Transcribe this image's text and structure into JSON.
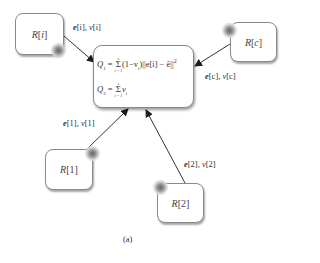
{
  "diagram": {
    "type": "network-diagram",
    "caption": "(a)",
    "center_node": {
      "q1_lhs": "Q",
      "q1_lhs_sub": "1",
      "q1_sum_upper": "c",
      "q1_sum_lower": "i = 1",
      "q1_rhs": "(1−v",
      "q1_rhs_sub": "i",
      "q1_rhs2": ")||e[i] − ē||",
      "q1_rhs_sup": "2",
      "q2_lhs": "Q",
      "q2_lhs_sub": "2",
      "q2_sum_upper": "c",
      "q2_sum_lower": "i = 1",
      "q2_rhs": "v",
      "q2_rhs_sub": "i"
    },
    "nodes": [
      {
        "id": "R[i]",
        "name_letter": "R",
        "index": "i"
      },
      {
        "id": "R[c]",
        "name_letter": "R",
        "index": "c"
      },
      {
        "id": "R[1]",
        "name_letter": "R",
        "index": "1"
      },
      {
        "id": "R[2]",
        "name_letter": "R",
        "index": "2"
      }
    ],
    "edges": [
      {
        "from": "R[i]",
        "to": "center",
        "label_e": "e",
        "label_idx_e": "[i]",
        "label_v": "v",
        "label_idx_v": "[i]"
      },
      {
        "from": "R[c]",
        "to": "center",
        "label_e": "e",
        "label_idx_e": "[c]",
        "label_v": "v",
        "label_idx_v": "[c]"
      },
      {
        "from": "R[1]",
        "to": "center",
        "label_e": "e",
        "label_idx_e": "[1]",
        "label_v": "v",
        "label_idx_v": "[1]"
      },
      {
        "from": "R[2]",
        "to": "center",
        "label_e": "e",
        "label_idx_e": "[2]",
        "label_v": "v",
        "label_idx_v": "[2]"
      }
    ],
    "colors": {
      "node_border": "#8a8a8a",
      "arrow": "#2a2a2a",
      "text": "#333333"
    }
  }
}
